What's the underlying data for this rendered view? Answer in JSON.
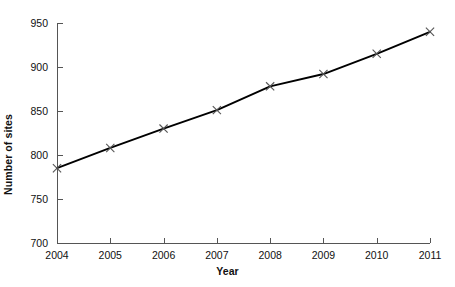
{
  "chart_data": {
    "type": "line",
    "title": "",
    "xlabel": "Year",
    "ylabel": "Number of sites",
    "x": [
      2004,
      2005,
      2006,
      2007,
      2008,
      2009,
      2010,
      2011
    ],
    "categories": [
      "2004",
      "2005",
      "2006",
      "2007",
      "2008",
      "2009",
      "2010",
      "2011"
    ],
    "series": [
      {
        "name": "Number of sites",
        "values": [
          785,
          808,
          830,
          851,
          878,
          892,
          915,
          940
        ],
        "color": "#000000",
        "marker": "x",
        "marker_color": "#555555"
      }
    ],
    "xlim": [
      2004,
      2011
    ],
    "ylim": [
      700,
      950
    ],
    "yticks": [
      700,
      750,
      800,
      850,
      900,
      950
    ],
    "ytick_labels": [
      "700",
      "750",
      "800",
      "850",
      "900",
      "950"
    ],
    "xticks": [
      2004,
      2005,
      2006,
      2007,
      2008,
      2009,
      2010,
      2011
    ],
    "xtick_labels": [
      "2004",
      "2005",
      "2006",
      "2007",
      "2008",
      "2009",
      "2010",
      "2011"
    ],
    "grid": false,
    "legend": false,
    "legend_position": "none",
    "background_color": "#ffffff",
    "axis_color": "#555555",
    "tick_direction": "in"
  },
  "plot_geometry": {
    "left": 57,
    "right": 430,
    "top": 23,
    "bottom": 243
  }
}
